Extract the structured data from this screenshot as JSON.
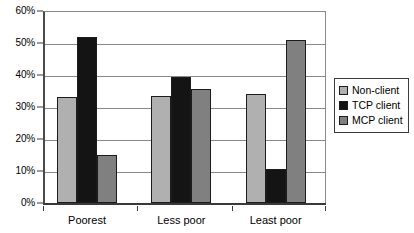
{
  "chart_data": {
    "type": "bar",
    "title": "",
    "subtitle": "",
    "xlabel": "",
    "ylabel": "",
    "categories": [
      "Poorest",
      "Less poor",
      "Least poor"
    ],
    "series": [
      {
        "name": "Non-client",
        "color": "#b0b0b0",
        "values": [
          33,
          33.5,
          34
        ]
      },
      {
        "name": "TCP client",
        "color": "#141414",
        "values": [
          52,
          39.5,
          10.5
        ]
      },
      {
        "name": "MCP client",
        "color": "#808080",
        "values": [
          15,
          35.5,
          51
        ]
      }
    ],
    "ylim": [
      0,
      60
    ],
    "ytick_values": [
      0,
      10,
      20,
      30,
      40,
      50,
      60
    ],
    "ytick_labels": [
      "0%",
      "10%",
      "20%",
      "30%",
      "40%",
      "50%",
      "60%"
    ],
    "grid": true,
    "grid_axis": "y",
    "legend_position": "right",
    "value_format": "percent"
  },
  "legend": {
    "items": [
      {
        "label": "Non-client",
        "swatch": "legend-swatch-non-client"
      },
      {
        "label": "TCP client",
        "swatch": "legend-swatch-tcp-client"
      },
      {
        "label": "MCP client",
        "swatch": "legend-swatch-mcp-client"
      }
    ]
  }
}
